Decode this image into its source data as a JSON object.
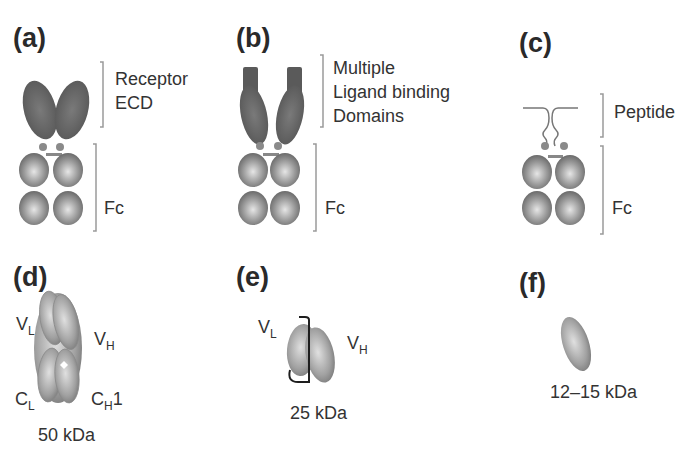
{
  "panels": {
    "a": {
      "label": "(a)",
      "top_label_line1": "Receptor",
      "top_label_line2": "ECD",
      "fc_label": "Fc"
    },
    "b": {
      "label": "(b)",
      "top_label_line1": "Multiple",
      "top_label_line2": "Ligand binding",
      "top_label_line3": "Domains",
      "fc_label": "Fc"
    },
    "c": {
      "label": "(c)",
      "top_label_line1": "Peptide",
      "fc_label": "Fc"
    },
    "d": {
      "label": "(d)",
      "vl": "V",
      "vl_sub": "L",
      "vh": "V",
      "vh_sub": "H",
      "cl": "C",
      "cl_sub": "L",
      "ch1": "C",
      "ch1_sub": "H",
      "ch1_suffix": "1",
      "mass": "50 kDa"
    },
    "e": {
      "label": "(e)",
      "vl": "V",
      "vl_sub": "L",
      "vh": "V",
      "vh_sub": "H",
      "mass": "25 kDa"
    },
    "f": {
      "label": "(f)",
      "mass": "12–15 kDa"
    }
  },
  "colors": {
    "domain_dark": "#5e5e5e",
    "domain_mid": "#8a8a8a",
    "domain_light": "#d8d8d8",
    "bracket": "#9a9a9a"
  }
}
